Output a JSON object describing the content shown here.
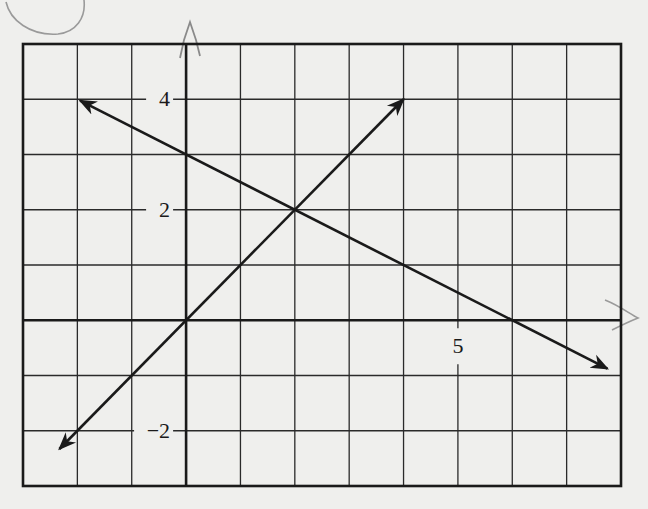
{
  "chart_data": {
    "type": "line",
    "title": "",
    "xlabel": "",
    "ylabel": "",
    "xlim": [
      -3,
      8
    ],
    "ylim": [
      -3,
      5
    ],
    "grid": true,
    "grid_step": 1,
    "x_tick_labels": [
      {
        "value": 5,
        "label": "5"
      }
    ],
    "y_tick_labels": [
      {
        "value": 4,
        "label": "4"
      },
      {
        "value": 2,
        "label": "2"
      },
      {
        "value": -2,
        "label": "−2"
      }
    ],
    "series": [
      {
        "name": "line-decreasing",
        "equation": "y = -x/2 + 3",
        "slope": -0.5,
        "intercept": 3,
        "x": [
          -1.95,
          7.75
        ],
        "arrows": "both"
      },
      {
        "name": "line-increasing",
        "equation": "y = x",
        "slope": 1,
        "intercept": 0,
        "x": [
          -2.33,
          4
        ],
        "arrows": "both"
      }
    ],
    "intersection": {
      "x": 2,
      "y": 2
    }
  },
  "colors": {
    "paper": "#efefed",
    "ink": "#1a1a1a",
    "grid": "#2a2a2a",
    "pencil": "#8a8a8a"
  }
}
